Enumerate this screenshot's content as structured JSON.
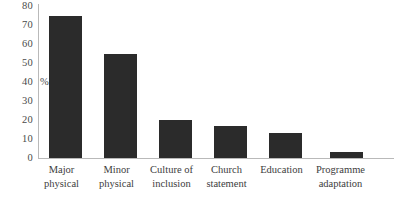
{
  "chart_data": {
    "type": "bar",
    "title": "",
    "subtitle": "",
    "xlabel": "",
    "ylabel": "%",
    "ylim": [
      0,
      80
    ],
    "ytick_step": 10,
    "yticks": [
      "80",
      "70",
      "60",
      "50",
      "40",
      "30",
      "20",
      "10",
      "0"
    ],
    "ylabel_anchor_tick": "40",
    "grid": false,
    "legend": false,
    "bar_color": "#2b2b2b",
    "axis_color": "#b9b9b9",
    "categories": [
      "Major physical",
      "Minor physical",
      "Culture of inclusion",
      "Church statement",
      "Education",
      "Programme adaptation"
    ],
    "category_lines": [
      [
        "Major",
        "physical"
      ],
      [
        "Minor",
        "physical"
      ],
      [
        "Culture of",
        "inclusion"
      ],
      [
        "Church",
        "statement"
      ],
      [
        "Education",
        ""
      ],
      [
        "Programme",
        "adaptation"
      ]
    ],
    "values": [
      75,
      55,
      20,
      17,
      13,
      3
    ]
  }
}
